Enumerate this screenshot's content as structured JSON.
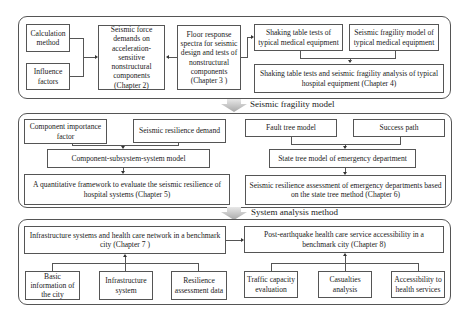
{
  "section1": {
    "calculation_method": "Calculation method",
    "influence_factors": "Influence factors",
    "seismic_force": "Seismic force demands on acceleration-sensitive nonstructural components (Chapter 2)",
    "floor_response": "Floor response spectra for seismic design and tests of nonstructural components (Chapter 3 )",
    "shaking_table_tests": "Shaking table tests of typical medical equipment",
    "fragility_model_equipment": "Seismic fragility model of typical medical equipment",
    "chapter4": "Shaking table tests and seismic fragility analysis of typical hospital equipment (Chapter 4)"
  },
  "stage1": {
    "label": "Seismic fragility model"
  },
  "section2": {
    "component_importance": "Component importance factor",
    "resilience_demand": "Seismic resilience demand",
    "css_model": "Component-subsystem-system model",
    "chapter5": "A quantitative framework to evaluate the seismic resilience of hospital systems (Chapter 5)",
    "fault_tree": "Fault tree model",
    "success_path": "Success path",
    "state_tree": "State tree model of emergency department",
    "chapter6": "Seismic resilience assessment of emergency departments based on the state tree method (Chapter 6)"
  },
  "stage2": {
    "label": "System analysis method"
  },
  "section3": {
    "chapter7": "Infrastructure systems and health care network in a benchmark city (Chapter 7 )",
    "basic_info": "Basic information of the city",
    "infrastructure_system": "Infrastructure system",
    "resilience_data": "Resilience assessment data",
    "chapter8": "Post-earthquake health care service accessibility in a benchmark city  (Chapter 8)",
    "traffic_capacity": "Traffic capacity evaluation",
    "casualties": "Casualties analysis",
    "accessibility": "Accessibility to health services"
  }
}
